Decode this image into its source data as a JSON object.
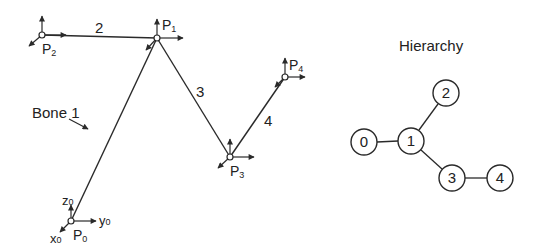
{
  "skeleton": {
    "joints": [
      {
        "id": "P0",
        "label": "P",
        "sub": "0",
        "x": 71,
        "y": 221
      },
      {
        "id": "P1",
        "label": "P",
        "sub": "1",
        "x": 157,
        "y": 38
      },
      {
        "id": "P2",
        "label": "P",
        "sub": "2",
        "x": 42,
        "y": 35
      },
      {
        "id": "P3",
        "label": "P",
        "sub": "3",
        "x": 230,
        "y": 157
      },
      {
        "id": "P4",
        "label": "P",
        "sub": "4",
        "x": 285,
        "y": 77
      }
    ],
    "bones": [
      {
        "label": "2",
        "from": "P2",
        "to": "P1"
      },
      {
        "label": "3",
        "from": "P1",
        "to": "P3"
      },
      {
        "label": "4",
        "from": "P3",
        "to": "P4"
      },
      {
        "label": "Bone 1",
        "from": "P0",
        "to": "P1"
      }
    ],
    "bone1_callout": "Bone 1",
    "bone_labels": {
      "b2": "2",
      "b3": "3",
      "b4": "4"
    },
    "axes": {
      "z": "z",
      "y": "y",
      "x": "x",
      "sub": "0"
    },
    "p_labels": {
      "p0": "P",
      "p0_sub": "0",
      "p1": "P",
      "p1_sub": "1",
      "p2": "P",
      "p2_sub": "2",
      "p3": "P",
      "p3_sub": "3",
      "p4": "P",
      "p4_sub": "4"
    }
  },
  "hierarchy": {
    "title": "Hierarchy",
    "nodes": [
      {
        "id": "0",
        "x": 364,
        "y": 142
      },
      {
        "id": "1",
        "x": 411,
        "y": 141
      },
      {
        "id": "2",
        "x": 446,
        "y": 93
      },
      {
        "id": "3",
        "x": 452,
        "y": 178
      },
      {
        "id": "4",
        "x": 500,
        "y": 178
      }
    ],
    "edges": [
      [
        "0",
        "1"
      ],
      [
        "1",
        "2"
      ],
      [
        "1",
        "3"
      ],
      [
        "3",
        "4"
      ]
    ],
    "labels": {
      "n0": "0",
      "n1": "1",
      "n2": "2",
      "n3": "3",
      "n4": "4"
    }
  },
  "colors": {
    "line": "#2a2a2a",
    "background": "#ffffff"
  }
}
